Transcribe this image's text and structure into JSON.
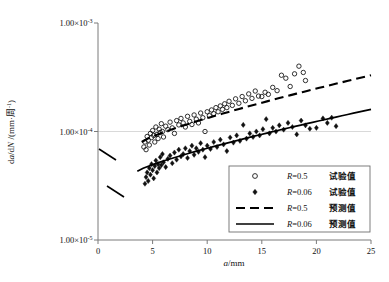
{
  "chart_data": {
    "type": "scatter",
    "title": "",
    "xlabel": "a/mm",
    "ylabel_main": "da",
    "ylabel_den": "dN",
    "ylabel_unit": "/(mm·周",
    "ylabel_unit_sup": "-1",
    "ylabel_unit_end": ")",
    "xlim": [
      0,
      25
    ],
    "ylim_log": [
      1e-05,
      0.001
    ],
    "yscale": "log",
    "grid": "horizontal-only",
    "xticks": [
      "0",
      "5",
      "10",
      "15",
      "20",
      "25"
    ],
    "xtick_values": [
      0,
      5,
      10,
      15,
      20,
      25
    ],
    "yticks": [
      {
        "mantissa": "1.00×10",
        "exp": "-5",
        "value": 1e-05
      },
      {
        "mantissa": "1.00×10",
        "exp": "-4",
        "value": 0.0001
      },
      {
        "mantissa": "1.00×10",
        "exp": "-3",
        "value": 0.001
      }
    ],
    "legend_position": "lower-right-inside",
    "series": [
      {
        "name": "R=0.5 试验值",
        "marker": "open-circle",
        "r_label": "R=0.5",
        "cn_label": "试验值",
        "points": [
          [
            4.2,
            7.2e-05
          ],
          [
            4.3,
            8e-05
          ],
          [
            4.4,
            6.8e-05
          ],
          [
            4.5,
            9e-05
          ],
          [
            4.6,
            8.3e-05
          ],
          [
            4.7,
            7.5e-05
          ],
          [
            4.8,
            9.6e-05
          ],
          [
            4.9,
            8.8e-05
          ],
          [
            5.0,
            0.000102
          ],
          [
            5.1,
            9.2e-05
          ],
          [
            5.2,
            8e-05
          ],
          [
            5.3,
            0.00011
          ],
          [
            5.4,
            9.4e-05
          ],
          [
            5.5,
            8.6e-05
          ],
          [
            5.6,
            0.000105
          ],
          [
            5.7,
            9.8e-05
          ],
          [
            5.8,
            0.000118
          ],
          [
            5.9,
            0.0001
          ],
          [
            6.0,
            8.9e-05
          ],
          [
            6.2,
            0.000112
          ],
          [
            6.4,
            0.000104
          ],
          [
            6.6,
            0.000122
          ],
          [
            6.8,
            0.000108
          ],
          [
            7.0,
            9.6e-05
          ],
          [
            7.2,
            0.000126
          ],
          [
            7.4,
            0.000115
          ],
          [
            7.6,
            0.000132
          ],
          [
            7.8,
            0.00012
          ],
          [
            8.0,
            0.00011
          ],
          [
            8.2,
            0.000138
          ],
          [
            8.4,
            0.000124
          ],
          [
            8.6,
            0.000116
          ],
          [
            8.8,
            0.000142
          ],
          [
            9.0,
            0.00013
          ],
          [
            9.2,
            0.00012
          ],
          [
            9.4,
            0.000148
          ],
          [
            9.6,
            0.000134
          ],
          [
            9.8,
            0.0001
          ],
          [
            10.0,
            0.000152
          ],
          [
            10.2,
            0.00014
          ],
          [
            10.4,
            0.000158
          ],
          [
            10.6,
            0.000146
          ],
          [
            10.8,
            0.000166
          ],
          [
            11.0,
            0.000152
          ],
          [
            11.2,
            0.000172
          ],
          [
            11.4,
            0.00016
          ],
          [
            11.6,
            0.00018
          ],
          [
            11.8,
            0.000166
          ],
          [
            12.0,
            0.00019
          ],
          [
            12.3,
            0.000174
          ],
          [
            12.6,
            0.0002
          ],
          [
            12.9,
            0.000182
          ],
          [
            13.2,
            0.00021
          ],
          [
            13.5,
            0.000192
          ],
          [
            13.8,
            0.000222
          ],
          [
            14.1,
            0.000202
          ],
          [
            14.4,
            0.000236
          ],
          [
            14.7,
            0.000212
          ],
          [
            15.0,
            0.00021
          ],
          [
            15.3,
            0.00023
          ],
          [
            15.6,
            0.00022
          ],
          [
            16.0,
            0.000255
          ],
          [
            16.4,
            0.000238
          ],
          [
            16.8,
            0.00033
          ],
          [
            17.2,
            0.00031
          ],
          [
            17.6,
            0.00026
          ],
          [
            18.0,
            0.00034
          ],
          [
            18.4,
            0.0004
          ],
          [
            18.8,
            0.00035
          ],
          [
            19.0,
            0.000295
          ]
        ]
      },
      {
        "name": "R=0.06 试验值",
        "marker": "filled-diamond",
        "r_label": "R=0.06",
        "cn_label": "试验值",
        "points": [
          [
            4.3,
            3.3e-05
          ],
          [
            4.4,
            3.8e-05
          ],
          [
            4.5,
            4.2e-05
          ],
          [
            4.6,
            3.5e-05
          ],
          [
            4.7,
            4.6e-05
          ],
          [
            4.8,
            4e-05
          ],
          [
            4.9,
            5e-05
          ],
          [
            5.0,
            4.4e-05
          ],
          [
            5.1,
            3.7e-05
          ],
          [
            5.2,
            4.8e-05
          ],
          [
            5.3,
            5.4e-05
          ],
          [
            5.4,
            4.2e-05
          ],
          [
            5.5,
            5e-05
          ],
          [
            5.6,
            4.6e-05
          ],
          [
            5.7,
            5.8e-05
          ],
          [
            5.8,
            4.9e-05
          ],
          [
            5.9,
            6.2e-05
          ],
          [
            6.0,
            5.2e-05
          ],
          [
            6.2,
            4.7e-05
          ],
          [
            6.4,
            5.6e-05
          ],
          [
            6.6,
            6e-05
          ],
          [
            6.8,
            5.1e-05
          ],
          [
            7.0,
            6.4e-05
          ],
          [
            7.2,
            5.5e-05
          ],
          [
            7.4,
            6.8e-05
          ],
          [
            7.6,
            5.9e-05
          ],
          [
            7.8,
            6.2e-05
          ],
          [
            8.0,
            7e-05
          ],
          [
            8.2,
            5.7e-05
          ],
          [
            8.4,
            6.6e-05
          ],
          [
            8.6,
            7.4e-05
          ],
          [
            8.8,
            6.1e-05
          ],
          [
            9.0,
            7e-05
          ],
          [
            9.2,
            6.5e-05
          ],
          [
            9.4,
            7.8e-05
          ],
          [
            9.6,
            6.8e-05
          ],
          [
            9.8,
            5.8e-05
          ],
          [
            10.0,
            7.4e-05
          ],
          [
            10.3,
            6.9e-05
          ],
          [
            10.6,
            8e-05
          ],
          [
            10.9,
            7.2e-05
          ],
          [
            11.2,
            8.4e-05
          ],
          [
            11.5,
            7.6e-05
          ],
          [
            11.8,
            6.6e-05
          ],
          [
            12.1,
            8.8e-05
          ],
          [
            12.4,
            7.9e-05
          ],
          [
            12.7,
            9.2e-05
          ],
          [
            13.0,
            8.2e-05
          ],
          [
            13.3,
            0.000115
          ],
          [
            13.6,
            8.6e-05
          ],
          [
            13.9,
            9.6e-05
          ],
          [
            14.2,
            8.9e-05
          ],
          [
            14.5,
            0.0001
          ],
          [
            14.8,
            9.2e-05
          ],
          [
            15.1,
            0.000105
          ],
          [
            15.4,
            0.00013
          ],
          [
            15.7,
            9.6e-05
          ],
          [
            16.0,
            0.000108
          ],
          [
            16.3,
            0.0001
          ],
          [
            16.6,
            0.000114
          ],
          [
            17.0,
            0.000104
          ],
          [
            17.4,
            0.00012
          ],
          [
            17.8,
            0.00011
          ],
          [
            18.2,
            9.4e-05
          ],
          [
            18.6,
            0.000126
          ],
          [
            19.0,
            0.000114
          ],
          [
            19.4,
            0.000106
          ],
          [
            20.0,
            0.000108
          ],
          [
            20.6,
            0.000132
          ],
          [
            21.0,
            0.00012
          ],
          [
            21.4,
            0.000134
          ],
          [
            21.8,
            0.000112
          ]
        ]
      }
    ],
    "fits": [
      {
        "name": "R=0.5 预测值",
        "style": "dashed",
        "r_label": "R=0.5",
        "cn_label": "预测值",
        "x_start": 4.0,
        "x_end": 25.0,
        "y_start": 8e-05,
        "y_end": 0.00033
      },
      {
        "name": "R=0.06 预测值",
        "style": "solid",
        "r_label": "R=0.06",
        "cn_label": "预测值",
        "x_start": 3.6,
        "x_end": 25.0,
        "y_start": 4.3e-05,
        "y_end": 0.00016
      }
    ],
    "legend_entries": [
      {
        "marker": "open-circle",
        "r_label": "R=0.5",
        "cn_label": "试验值"
      },
      {
        "marker": "filled-diamond",
        "r_label": "R=0.06",
        "cn_label": "试验值"
      },
      {
        "marker": "dashed-line",
        "r_label": "R=0.5",
        "cn_label": "预测值"
      },
      {
        "marker": "solid-line",
        "r_label": "R=0.06",
        "cn_label": "预测值"
      }
    ],
    "colors": {
      "marker": "#111111",
      "line": "#000000",
      "axis": "#7b7b7b",
      "grid": "#c9c9c9",
      "background": "#ffffff"
    }
  }
}
